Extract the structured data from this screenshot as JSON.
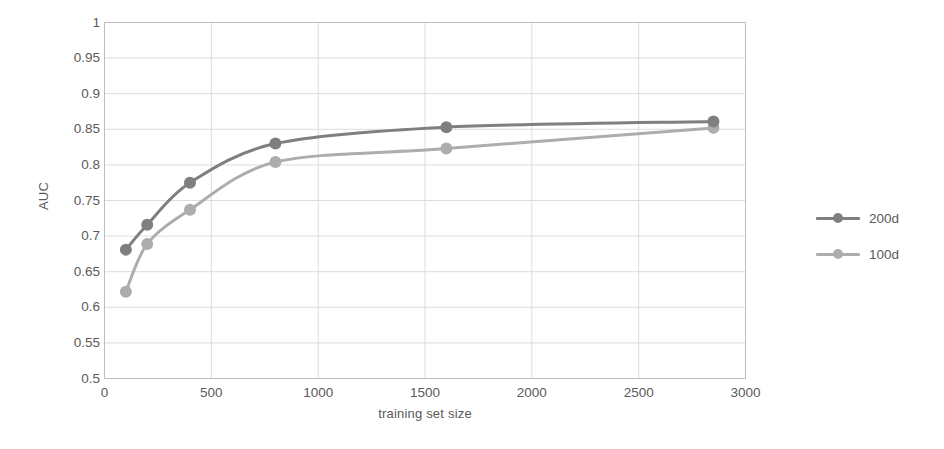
{
  "chart_data": {
    "type": "line",
    "title": "",
    "xlabel": "training set size",
    "ylabel": "AUC",
    "xlim": [
      0,
      3000
    ],
    "ylim": [
      0.5,
      1
    ],
    "xticks": [
      0,
      500,
      1000,
      1500,
      2000,
      2500,
      3000
    ],
    "xtick_labels": [
      "0",
      "500",
      "1000",
      "1500",
      "2000",
      "2500",
      "3000"
    ],
    "yticks": [
      0.5,
      0.55,
      0.6,
      0.65,
      0.7,
      0.75,
      0.8,
      0.85,
      0.9,
      0.95,
      1
    ],
    "ytick_labels": [
      "0.5",
      "0.55",
      "0.6",
      "0.65",
      "0.7",
      "0.75",
      "0.8",
      "0.85",
      "0.9",
      "0.95",
      "1"
    ],
    "grid": true,
    "legend_position": "right",
    "series": [
      {
        "name": "200d",
        "color": "#7f7f7f",
        "x": [
          100,
          200,
          400,
          800,
          1600,
          2850
        ],
        "values": [
          0.681,
          0.716,
          0.775,
          0.83,
          0.853,
          0.861
        ]
      },
      {
        "name": "100d",
        "color": "#adadad",
        "x": [
          100,
          200,
          400,
          800,
          1600,
          2850
        ],
        "values": [
          0.622,
          0.689,
          0.737,
          0.804,
          0.823,
          0.852
        ]
      }
    ]
  },
  "axes": {
    "ylabel": "AUC",
    "xlabel": "training set size"
  },
  "legend": {
    "items": [
      {
        "label": "200d",
        "color": "#7f7f7f"
      },
      {
        "label": "100d",
        "color": "#adadad"
      }
    ]
  },
  "colors": {
    "series_200d": "#7f7f7f",
    "series_100d": "#adadad",
    "grid": "#d9d9d9",
    "axis": "#bfbfbf",
    "text": "#595959",
    "background": "#ffffff"
  }
}
